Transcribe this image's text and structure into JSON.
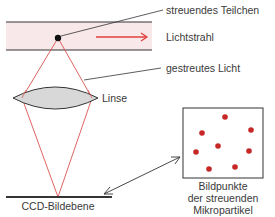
{
  "labels": {
    "particle": "streuendes Teilchen",
    "beam": "Lichtstrahl",
    "scattered": "gestreutes Licht",
    "lens": "Linse",
    "ccd": "CCD-Bildebene",
    "image_points_line1": "Bildpunkte",
    "image_points_line2": "der streuenden",
    "image_points_line3": "Mikropartikel"
  },
  "colors": {
    "beam_band": "#f8e8ea",
    "ray": "#d9534f",
    "arrow": "#e0403a",
    "dot": "#c62828",
    "lens_fill": "#d8d8d8",
    "line": "#333333"
  },
  "image_points": [
    {
      "x": 225,
      "y": 117
    },
    {
      "x": 202,
      "y": 133
    },
    {
      "x": 251,
      "y": 130
    },
    {
      "x": 218,
      "y": 146
    },
    {
      "x": 196,
      "y": 152
    },
    {
      "x": 249,
      "y": 151
    },
    {
      "x": 209,
      "y": 169
    },
    {
      "x": 235,
      "y": 167
    }
  ]
}
